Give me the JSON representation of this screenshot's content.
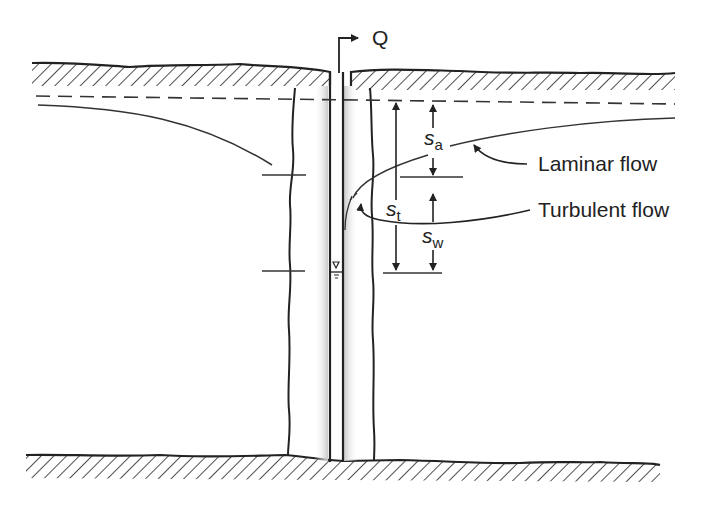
{
  "figure": {
    "discharge_label": "Q",
    "symbols": {
      "s_a": {
        "base": "s",
        "sub": "a"
      },
      "s_t": {
        "base": "s",
        "sub": "t"
      },
      "s_w": {
        "base": "s",
        "sub": "w"
      }
    },
    "annotations": {
      "laminar": "Laminar flow",
      "turbulent": "Turbulent flow"
    },
    "water_table_symbol": "▽"
  },
  "colors": {
    "line": "#1f1f1f",
    "shade": "#cfcfcf",
    "background": "#ffffff"
  }
}
